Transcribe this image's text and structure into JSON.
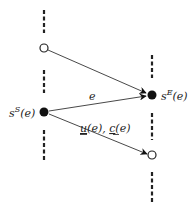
{
  "diagram": {
    "type": "network-edge-schematic",
    "colors": {
      "line": "#333333",
      "node_fill": "#111111",
      "background": "#ffffff"
    },
    "columns": [
      {
        "id": "left-column",
        "x": 44,
        "dashed_segments": [
          [
            10,
            33
          ],
          [
            70,
            93
          ],
          [
            130,
            160
          ]
        ]
      },
      {
        "id": "right-column",
        "x": 152,
        "dashed_segments": [
          [
            55,
            78
          ],
          [
            113,
            140
          ],
          [
            172,
            202
          ]
        ]
      }
    ],
    "nodes": [
      {
        "id": "left-open",
        "x": 44,
        "y": 48,
        "style": "open"
      },
      {
        "id": "start-node",
        "x": 44,
        "y": 112,
        "style": "filled",
        "label": {
          "base": "s",
          "sup": "S",
          "arg": "(e)"
        }
      },
      {
        "id": "end-node",
        "x": 152,
        "y": 95,
        "style": "filled",
        "label": {
          "base": "s",
          "sup": "E",
          "arg": "(e)"
        }
      },
      {
        "id": "right-open",
        "x": 152,
        "y": 155,
        "style": "open"
      }
    ],
    "edges": [
      {
        "id": "upper-edge",
        "from": "left-open",
        "to": "end-node"
      },
      {
        "id": "edge-e",
        "from": "start-node",
        "to": "end-node",
        "label": "e"
      },
      {
        "id": "lower-edge",
        "from": "start-node",
        "to": "right-open",
        "label": "u(e), c(e)"
      }
    ],
    "labels": {
      "start_node_base": "s",
      "start_node_sup": "S",
      "start_node_arg": "(e)",
      "end_node_base": "s",
      "end_node_sup": "E",
      "end_node_arg": "(e)",
      "edge_e": "e",
      "lower_edge_u": "u",
      "lower_edge_u_arg": "(e), ",
      "lower_edge_c": "c",
      "lower_edge_c_arg": "(e)"
    }
  }
}
